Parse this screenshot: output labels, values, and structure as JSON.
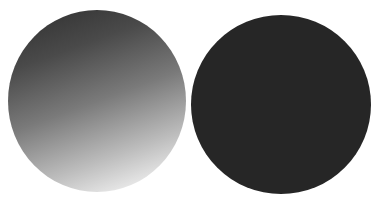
{
  "caption": {
    "text": "",
    "note": "top text row is cropped; only bottom edges of glyphs visible"
  },
  "figures": [
    {
      "name": "gradient-circle",
      "shape": "circle",
      "fill": "linear-gradient",
      "colors": [
        "#2e2e2e",
        "#7a7a7a",
        "#ffffff"
      ],
      "direction": "top-left dark to bottom-right light"
    },
    {
      "name": "solid-circle",
      "shape": "circle",
      "fill": "solid",
      "colors": [
        "#262626"
      ]
    }
  ]
}
